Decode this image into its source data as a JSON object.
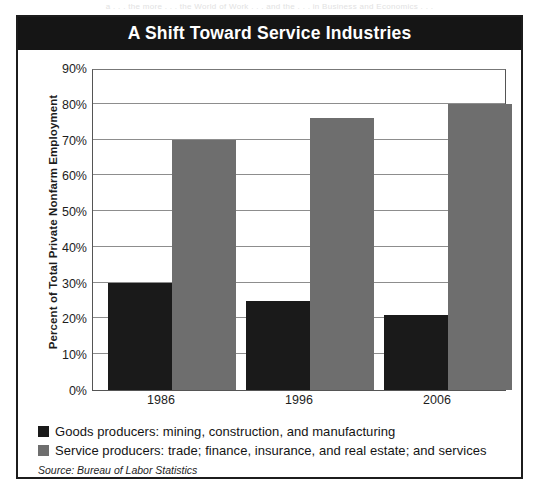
{
  "page": {
    "bleed_text": "a  . . .  the  more  . . .  the  World  of  Work  . . .  and  the  . . .  in  Business  and  Economics  . . ."
  },
  "chart_data": {
    "type": "bar",
    "title": "A Shift Toward Service Industries",
    "xlabel": "",
    "ylabel": "Percent of Total Private Nonfarm Employment",
    "categories": [
      "1986",
      "1996",
      "2006"
    ],
    "series": [
      {
        "name": "Goods producers: mining, construction, and manufacturing",
        "color": "#1a1a1a",
        "values": [
          30,
          25,
          21
        ]
      },
      {
        "name": "Service producers: trade; finance, insurance, and real estate; and services",
        "color": "#6e6e6e",
        "values": [
          70,
          76,
          80
        ]
      }
    ],
    "ylim": [
      0,
      90
    ],
    "ytick_values": [
      0,
      10,
      20,
      30,
      40,
      50,
      60,
      70,
      80,
      90
    ],
    "ytick_labels": [
      "0%",
      "10%",
      "20%",
      "30%",
      "40%",
      "50%",
      "60%",
      "70%",
      "80%",
      "90%"
    ],
    "grid": true,
    "legend_position": "bottom-left",
    "source": "Source: Bureau of Labor Statistics"
  }
}
